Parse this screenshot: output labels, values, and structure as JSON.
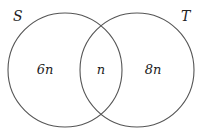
{
  "diagram": {
    "type": "venn",
    "sets": [
      {
        "name": "S",
        "label": "S",
        "cx": 65,
        "cy": 70,
        "r": 57
      },
      {
        "name": "T",
        "label": "T",
        "cx": 137,
        "cy": 70,
        "r": 57
      }
    ],
    "regions": [
      {
        "id": "s-only",
        "label": "6n",
        "x": 45,
        "y": 74
      },
      {
        "id": "s-and-t",
        "label": "n",
        "x": 101,
        "y": 74
      },
      {
        "id": "t-only",
        "label": "8n",
        "x": 153,
        "y": 74
      }
    ],
    "stroke_color": "#555555",
    "text_color": "#222222"
  }
}
